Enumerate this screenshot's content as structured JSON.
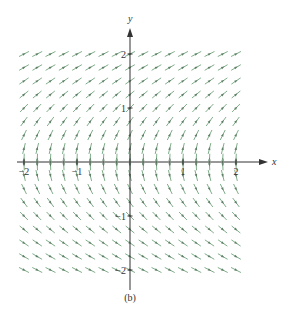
{
  "chart_data": {
    "type": "vector_field",
    "title": "",
    "caption": "(b)",
    "xlabel": "x",
    "ylabel": "y",
    "xlim": [
      -2,
      2
    ],
    "ylim": [
      -2,
      2
    ],
    "grid": false,
    "x_ticks": [
      {
        "value": -2,
        "label": "−2"
      },
      {
        "value": -1,
        "label": "−1"
      },
      {
        "value": 1,
        "label": "1"
      },
      {
        "value": 2,
        "label": "2"
      }
    ],
    "y_ticks": [
      {
        "value": 2,
        "label": "2"
      },
      {
        "value": 1,
        "label": "1"
      },
      {
        "value": -1,
        "label": "−1"
      },
      {
        "value": -2,
        "label": "−2"
      }
    ],
    "field": {
      "description": "direction field; slopes positive and shallow at large y, steep near y=0 for y>0; mirrored with negative slopes for y<0 (consistent with dy/dx = 1/y)",
      "slope_function": "1/y",
      "x_samples": [
        -2,
        -1.75,
        -1.5,
        -1.25,
        -1,
        -0.75,
        -0.5,
        -0.25,
        0,
        0.25,
        0.5,
        0.75,
        1,
        1.25,
        1.5,
        1.75,
        2
      ],
      "y_samples_upper": [
        2,
        1.75,
        1.5,
        1.25,
        1,
        0.75,
        0.5,
        0.25,
        0.05
      ],
      "y_samples_lower": [
        -0.05,
        -0.25,
        -0.5,
        -0.75,
        -1,
        -1.25,
        -1.5,
        -1.75,
        -2
      ],
      "arrow_color": "#7fae8a",
      "arrow_head_color": "#5f7f66"
    }
  },
  "figure": {
    "caption": "(b)",
    "axis_color": "#333333"
  }
}
